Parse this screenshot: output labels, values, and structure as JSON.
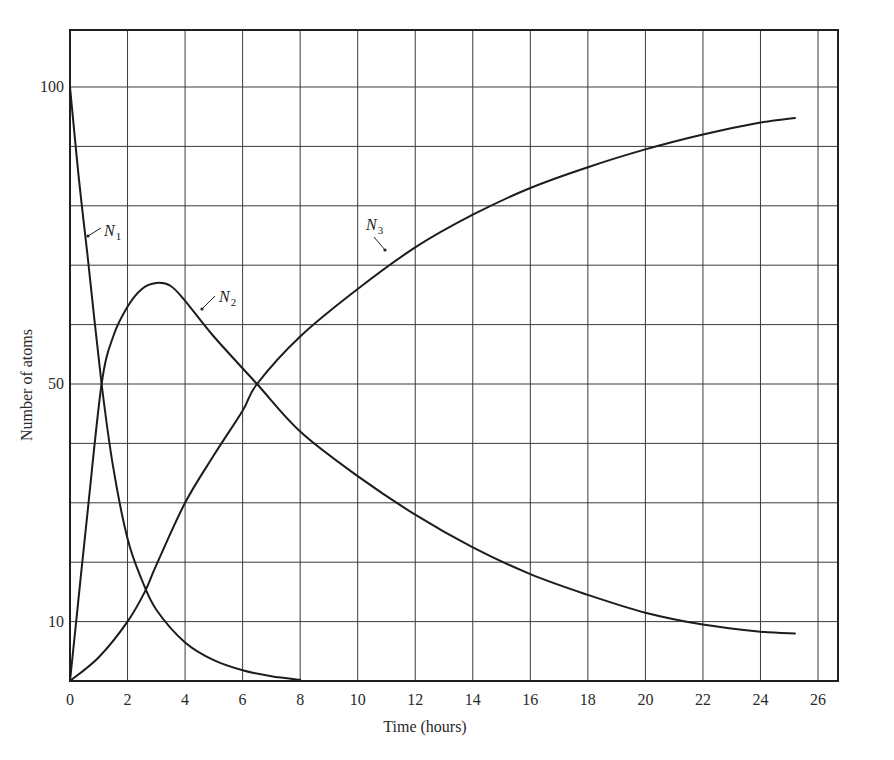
{
  "chart_data": {
    "type": "line",
    "title": "",
    "xlabel": "Time (hours)",
    "ylabel": "Number of atoms",
    "xlim": [
      0,
      27.5
    ],
    "ylim": [
      0,
      110
    ],
    "grid": true,
    "legend": "none (inline curve labels N1, N2, N3)",
    "x_ticks": [
      0,
      2,
      4,
      6,
      8,
      10,
      12,
      14,
      16,
      18,
      20,
      22,
      24,
      26
    ],
    "x_tick_labels": [
      "0",
      "2",
      "4",
      "6",
      "8",
      "10",
      "12",
      "14",
      "16",
      "18",
      "20",
      "22",
      "24",
      "26"
    ],
    "y_ticks": [
      10,
      50,
      100
    ],
    "y_tick_labels": [
      "10",
      "50",
      "100"
    ],
    "y_grid_step": 10,
    "series": [
      {
        "name": "N1",
        "label": "N",
        "sub": "1",
        "x": [
          0,
          0.3,
          0.6,
          1.1,
          1.5,
          2,
          2.5,
          3,
          4,
          5,
          6,
          7,
          8
        ],
        "values": [
          100,
          85,
          72,
          50,
          36,
          24,
          17,
          12,
          6.5,
          3.5,
          1.8,
          0.8,
          0.2
        ]
      },
      {
        "name": "N2",
        "label": "N",
        "sub": "2",
        "x": [
          0,
          0.3,
          0.6,
          1.1,
          1.5,
          2,
          2.5,
          3,
          3.5,
          4,
          5,
          6.5,
          8,
          10,
          12,
          14,
          16,
          18,
          20,
          22,
          24,
          25.2
        ],
        "values": [
          0,
          14,
          28,
          50,
          58,
          63,
          66,
          67,
          66.5,
          64,
          58,
          50,
          42,
          34.5,
          28,
          22.5,
          18,
          14.5,
          11.5,
          9.5,
          8.3,
          8.0
        ]
      },
      {
        "name": "N3",
        "label": "N",
        "sub": "3",
        "x": [
          0,
          1,
          2,
          2.6,
          3,
          4,
          5,
          6,
          6.5,
          8,
          10,
          12,
          14,
          16,
          18,
          20,
          22,
          24,
          25.2
        ],
        "values": [
          0,
          4,
          10,
          15,
          19.5,
          30,
          38,
          45.5,
          50,
          58,
          66,
          73,
          78.5,
          83,
          86.5,
          89.5,
          92,
          94,
          94.8
        ]
      }
    ],
    "annotations": [
      {
        "text": "N1",
        "near_x": 1.3,
        "near_y": 77
      },
      {
        "text": "N2",
        "near_x": 5.6,
        "near_y": 66
      },
      {
        "text": "N3",
        "near_x": 10.6,
        "near_y": 72
      }
    ]
  }
}
